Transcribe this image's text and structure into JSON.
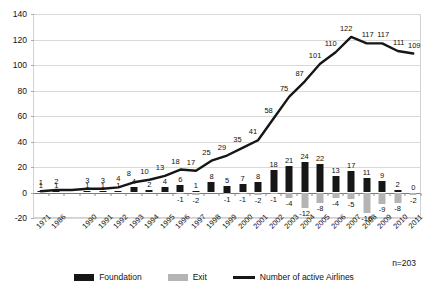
{
  "chart_data": {
    "type": "bar",
    "title": "",
    "subtitle": "",
    "xlabel": "",
    "ylabel": "",
    "ylim": [
      -20,
      140
    ],
    "ytick_step": 20,
    "yticks": [
      -20,
      0,
      20,
      40,
      60,
      80,
      100,
      120,
      140
    ],
    "grid": true,
    "legend_position": "bottom",
    "annotation": "n=203",
    "categories": [
      "1971",
      "1986",
      "",
      "1990",
      "1991",
      "1992",
      "1993",
      "1994",
      "1995",
      "1996",
      "1997",
      "1998",
      "1999",
      "2000",
      "2001",
      "2002",
      "2003",
      "2004",
      "2005",
      "2006",
      "2007",
      "2008",
      "2009",
      "2010",
      "2011"
    ],
    "tick_labels": [
      "1971",
      "1986",
      "",
      "1990",
      "1991",
      "1992",
      "1993",
      "1994",
      "1995",
      "1996",
      "1997",
      "1998",
      "1999",
      "2000",
      "2001",
      "2002",
      "2003",
      "2004",
      "2005",
      "2006",
      "2007",
      "2008",
      "2009",
      "2010",
      "2011"
    ],
    "series": [
      {
        "name": "Foundation",
        "type": "bar",
        "color": "#161616",
        "values": [
          1,
          1,
          0,
          1,
          1,
          1,
          4,
          2,
          4,
          6,
          1,
          8,
          5,
          7,
          8,
          18,
          21,
          24,
          22,
          13,
          17,
          11,
          9,
          2,
          0
        ],
        "labels": [
          "1",
          "1",
          "",
          "1",
          "1",
          "1",
          "4",
          "2",
          "4",
          "6",
          "1",
          "8",
          "5",
          "7",
          "8",
          "18",
          "21",
          "24",
          "22",
          "13",
          "17",
          "11",
          "9",
          "2",
          "0"
        ]
      },
      {
        "name": "Exit",
        "type": "bar",
        "color": "#b4b4b4",
        "values": [
          0,
          0,
          0,
          0,
          0,
          0,
          0,
          0,
          0,
          -1,
          -2,
          0,
          -1,
          -1,
          -2,
          -1,
          -4,
          -12,
          -8,
          -4,
          -5,
          -16,
          -9,
          -8,
          -2
        ],
        "labels": [
          "",
          "",
          "",
          "",
          "",
          "",
          "",
          "",
          "",
          "-1",
          "-2",
          "",
          "-1",
          "-1",
          "-2",
          "-1",
          "-4",
          "-12",
          "-8",
          "-4",
          "-5",
          "-16",
          "-9",
          "-8",
          "-2"
        ]
      },
      {
        "name": "Number of active Airlines",
        "type": "line",
        "color": "#161616",
        "values": [
          1,
          2,
          2,
          3,
          3,
          4,
          8,
          10,
          13,
          18,
          17,
          25,
          29,
          35,
          41,
          58,
          75,
          87,
          101,
          110,
          122,
          117,
          117,
          111,
          109
        ],
        "labels": [
          "1",
          "2",
          "",
          "3",
          "3",
          "4",
          "8",
          "10",
          "13",
          "18",
          "17",
          "25",
          "29",
          "35",
          "41",
          "58",
          "75",
          "87",
          "101",
          "110",
          "122",
          "117",
          "117",
          "111",
          "109"
        ]
      }
    ],
    "legend": [
      {
        "label": "Foundation",
        "marker": "square",
        "color": "#161616"
      },
      {
        "label": "Exit",
        "marker": "square",
        "color": "#b4b4b4"
      },
      {
        "label": "Number of active Airlines",
        "marker": "line",
        "color": "#161616"
      }
    ]
  }
}
